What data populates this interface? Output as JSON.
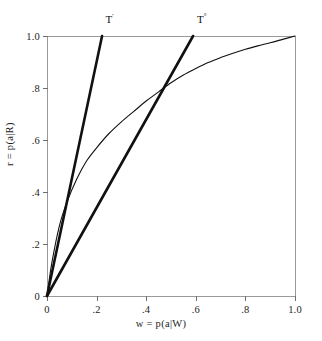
{
  "chart_data": {
    "type": "line",
    "title": "",
    "xlabel": "w = p(a|W)",
    "ylabel": "r = p(a|R)",
    "xlim": [
      0,
      1
    ],
    "ylim": [
      0,
      1
    ],
    "grid": false,
    "legend_position": "inline-annotations",
    "xticks": [
      0,
      0.2,
      0.4,
      0.6,
      0.8,
      1.0
    ],
    "xtick_labels": [
      "0",
      ".2",
      ".4",
      ".6",
      ".8",
      "1.0"
    ],
    "yticks": [
      0,
      0.2,
      0.4,
      0.6,
      0.8,
      1.0
    ],
    "ytick_labels": [
      "0",
      ".2",
      ".4",
      ".6",
      ".8",
      "1.0"
    ],
    "series": [
      {
        "name": "T'",
        "kind": "line",
        "style": "thick-straight",
        "annotation": "T'",
        "annotation_at": [
          0.236,
          1.065
        ],
        "x": [
          0.0,
          0.222
        ],
        "y": [
          0.0,
          1.0
        ],
        "slope": 4.5
      },
      {
        "name": "T°",
        "kind": "line",
        "style": "thick-straight",
        "annotation": "T°",
        "annotation_at": [
          0.605,
          1.065
        ],
        "x": [
          0.0,
          0.589
        ],
        "y": [
          0.0,
          1.0
        ],
        "slope": 1.7
      },
      {
        "name": "ROC curve",
        "kind": "curve",
        "style": "thin-curved",
        "annotation": "",
        "x": [
          0.0,
          0.02,
          0.05,
          0.08,
          0.12,
          0.16,
          0.2,
          0.25,
          0.3,
          0.35,
          0.4,
          0.45,
          0.5,
          0.55,
          0.6,
          0.65,
          0.7,
          0.75,
          0.8,
          0.85,
          0.9,
          0.95,
          1.0
        ],
        "y": [
          0.0,
          0.13,
          0.27,
          0.36,
          0.45,
          0.52,
          0.57,
          0.625,
          0.67,
          0.71,
          0.75,
          0.785,
          0.82,
          0.85,
          0.875,
          0.898,
          0.917,
          0.934,
          0.949,
          0.962,
          0.974,
          0.987,
          1.0
        ]
      }
    ],
    "annotations": [
      {
        "label": "T'",
        "x": 0.236,
        "y": 1.065
      },
      {
        "label": "T°",
        "x": 0.605,
        "y": 1.065
      }
    ],
    "intersections": [
      {
        "between": [
          "T°",
          "ROC curve"
        ],
        "x": 0.496,
        "y": 0.819
      }
    ],
    "colors": {
      "curve": "#111111",
      "axis": "#9a9a9a",
      "tick": "#6e6e6e",
      "text": "#1d1d1d",
      "background": "#ffffff"
    }
  }
}
